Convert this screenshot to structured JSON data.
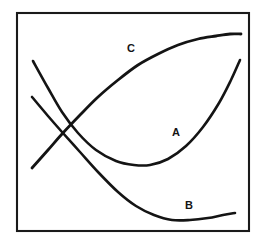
{
  "figure": {
    "title": "",
    "background_color": "#ffffff",
    "line_color": "#141414",
    "frame_color": "#1a1a1a",
    "frame": {
      "x": 17,
      "y": 13,
      "width": 232,
      "height": 218,
      "stroke_width": 2.1
    }
  },
  "chart_data": {
    "type": "line",
    "title": "",
    "xlabel": "",
    "ylabel": "",
    "xlim": [
      17,
      249
    ],
    "ylim": [
      13,
      231
    ],
    "grid": false,
    "axes_ticks": false,
    "legend": "inline-curve-labels",
    "series": [
      {
        "name": "A",
        "label": "A",
        "label_x": 176,
        "label_y": 133,
        "stroke_width": 2.6,
        "shape": "u-shaped convex curve, descends steeply from upper-left, minimum near center-right, rises steeply to upper-right",
        "points": [
          [
            33,
            61
          ],
          [
            48,
            88
          ],
          [
            62,
            112
          ],
          [
            78,
            133
          ],
          [
            96,
            150
          ],
          [
            116,
            161
          ],
          [
            134,
            165
          ],
          [
            150,
            165
          ],
          [
            168,
            159
          ],
          [
            186,
            146
          ],
          [
            203,
            127
          ],
          [
            219,
            103
          ],
          [
            231,
            80
          ],
          [
            240,
            60
          ]
        ]
      },
      {
        "name": "B",
        "label": "B",
        "label_x": 189,
        "label_y": 206,
        "stroke_width": 2.6,
        "shape": "descends from upper-left crossing region, shallow minimum near lower-right, slight rise at far right",
        "points": [
          [
            32,
            97
          ],
          [
            48,
            116
          ],
          [
            62,
            132
          ],
          [
            80,
            152
          ],
          [
            98,
            172
          ],
          [
            118,
            192
          ],
          [
            136,
            206
          ],
          [
            154,
            215
          ],
          [
            172,
            220
          ],
          [
            190,
            220
          ],
          [
            208,
            218
          ],
          [
            223,
            215
          ],
          [
            235,
            213
          ]
        ]
      },
      {
        "name": "C",
        "label": "C",
        "label_x": 131,
        "label_y": 49,
        "stroke_width": 2.8,
        "shape": "concave-down rising curve from lower-left, steep at first then flattening to a plateau at upper-right",
        "points": [
          [
            32,
            168
          ],
          [
            48,
            150
          ],
          [
            62,
            134
          ],
          [
            80,
            115
          ],
          [
            98,
            97
          ],
          [
            118,
            80
          ],
          [
            138,
            65
          ],
          [
            158,
            54
          ],
          [
            178,
            45
          ],
          [
            198,
            39
          ],
          [
            216,
            36
          ],
          [
            230,
            34
          ],
          [
            241,
            34
          ]
        ]
      }
    ],
    "intersections": [
      {
        "between": [
          "A",
          "B"
        ],
        "x": 57,
        "y": 127
      },
      {
        "between": [
          "A",
          "C"
        ],
        "x": 60,
        "y": 130
      },
      {
        "between": [
          "B",
          "C"
        ],
        "x": 56,
        "y": 125
      }
    ]
  },
  "labels": {
    "a": "A",
    "b": "B",
    "c": "C"
  }
}
